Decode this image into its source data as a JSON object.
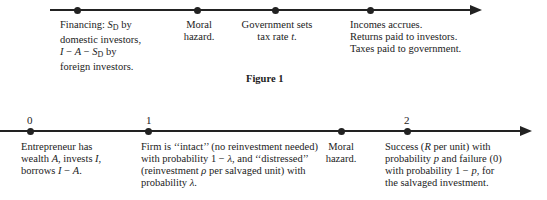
{
  "figure1": {
    "caption": "Figure 1",
    "events": [
      {
        "id": "financing",
        "lines": [
          "Financing: S_D by",
          "domestic investors,",
          "I − A − S_D by",
          "foreign investors."
        ]
      },
      {
        "id": "moral-hazard",
        "lines": [
          "Moral",
          "hazard."
        ]
      },
      {
        "id": "tax",
        "lines": [
          "Government sets",
          "tax rate t."
        ]
      },
      {
        "id": "incomes",
        "lines": [
          "Incomes accrues.",
          "Returns paid to investors.",
          "Taxes paid to government."
        ]
      }
    ]
  },
  "figure2": {
    "ticks": [
      "0",
      "1",
      "2"
    ],
    "events": [
      {
        "id": "date0",
        "lines": [
          "Entrepreneur has",
          "wealth A, invests I,",
          "borrows I − A."
        ]
      },
      {
        "id": "date1",
        "lines": [
          "Firm is ‘‘intact’’ (no reinvestment needed)",
          "with probability 1 − λ, and ‘‘distressed’’",
          "(reinvestment ρ per salvaged unit) with",
          "probability λ."
        ]
      },
      {
        "id": "moral-hazard",
        "lines": [
          "Moral",
          "hazard."
        ]
      },
      {
        "id": "date2",
        "lines": [
          "Success (R per unit) with",
          "probability p and failure (0)",
          "with probability 1 − p, for",
          "the salvaged investment."
        ]
      }
    ]
  }
}
